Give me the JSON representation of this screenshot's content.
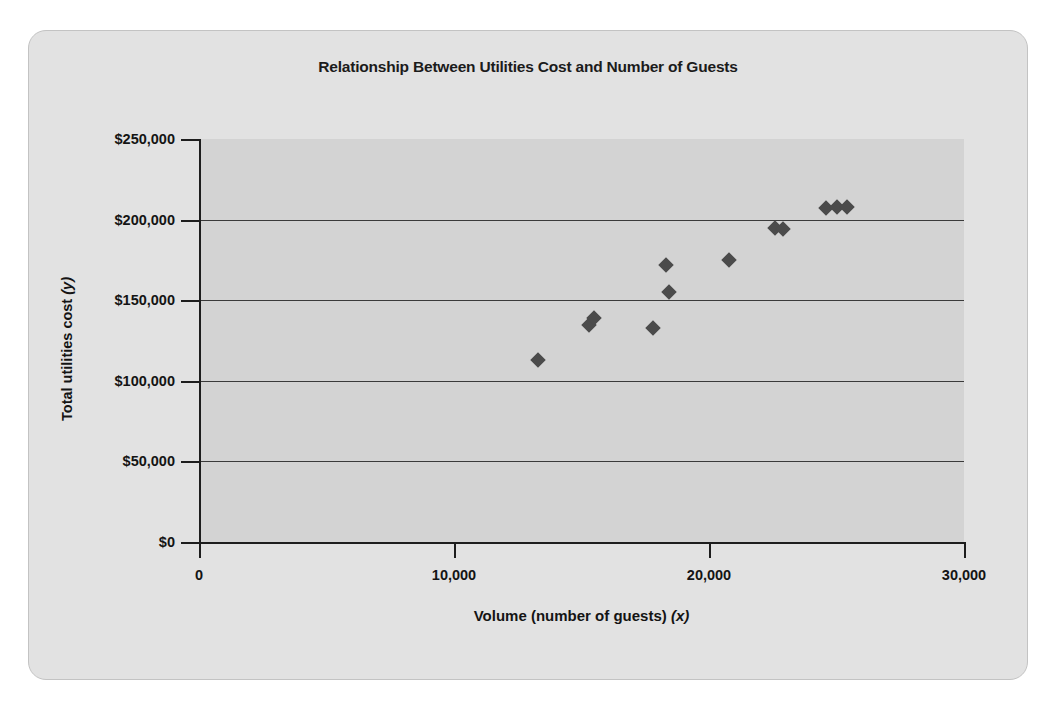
{
  "chart_data": {
    "type": "scatter",
    "title": "Relationship Between Utilities Cost and Number of Guests",
    "xlabel": "Volume (number of guests) (x)",
    "ylabel": "Total utilities cost (y)",
    "xlabel_main": "Volume (number of guests) ",
    "xlabel_var": "(x)",
    "ylabel_main": "Total utilities cost ",
    "ylabel_var": "(y)",
    "xlim": [
      0,
      30000
    ],
    "ylim": [
      0,
      250000
    ],
    "xticks": [
      0,
      10000,
      20000,
      30000
    ],
    "xtick_labels": [
      "0",
      "10,000",
      "20,000",
      "30,000"
    ],
    "yticks": [
      0,
      50000,
      100000,
      150000,
      200000,
      250000
    ],
    "ytick_labels": [
      "$0",
      "$50,000",
      "$100,000",
      "$150,000",
      "$200,000",
      "$250,000"
    ],
    "grid": "horizontal",
    "legend": "none",
    "marker": "diamond",
    "marker_color": "#4b4b4b",
    "plot_background": "#d3d3d3",
    "figure_background": "#e2e2e2",
    "points": [
      {
        "x": 13300,
        "y": 113000
      },
      {
        "x": 15300,
        "y": 134500
      },
      {
        "x": 15500,
        "y": 139000
      },
      {
        "x": 17800,
        "y": 133000
      },
      {
        "x": 18300,
        "y": 172000
      },
      {
        "x": 18450,
        "y": 155000
      },
      {
        "x": 20800,
        "y": 175000
      },
      {
        "x": 22600,
        "y": 195000
      },
      {
        "x": 22900,
        "y": 194000
      },
      {
        "x": 24600,
        "y": 207500
      },
      {
        "x": 25000,
        "y": 208000
      },
      {
        "x": 25400,
        "y": 208000
      }
    ]
  }
}
